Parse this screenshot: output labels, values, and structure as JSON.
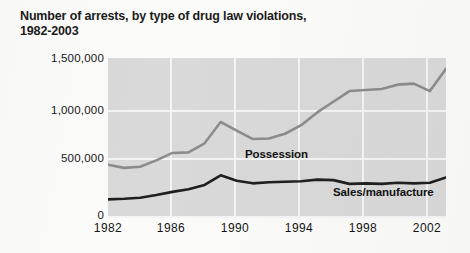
{
  "chart_data": {
    "type": "line",
    "title": "Number of arrests, by type of drug law violations, 1982-2003",
    "xlabel": "",
    "ylabel": "",
    "xlim": [
      1982,
      2003
    ],
    "ylim": [
      0,
      1500000
    ],
    "grid": true,
    "legend_position": "inline-annotation",
    "y_ticks": [
      "0",
      "500,000",
      "1,000,000",
      "1,500,000"
    ],
    "y_tick_values": [
      0,
      500000,
      1000000,
      1500000
    ],
    "x_ticks": [
      "1982",
      "1986",
      "1990",
      "1994",
      "1998",
      "2002"
    ],
    "x_tick_values": [
      1982,
      1986,
      1990,
      1994,
      1998,
      2002
    ],
    "x": [
      1982,
      1983,
      1984,
      1985,
      1986,
      1987,
      1988,
      1989,
      1990,
      1991,
      1992,
      1993,
      1994,
      1995,
      1996,
      1997,
      1998,
      1999,
      2000,
      2001,
      2002,
      2003
    ],
    "series": [
      {
        "name": "Possession",
        "color": "#8c8c8c",
        "values": [
          500000,
          470000,
          480000,
          540000,
          610000,
          615000,
          700000,
          900000,
          820000,
          740000,
          745000,
          790000,
          870000,
          990000,
          1090000,
          1190000,
          1200000,
          1210000,
          1250000,
          1260000,
          1190000,
          1400000
        ]
      },
      {
        "name": "Sales/manufacture",
        "color": "#1f1f1f",
        "values": [
          175000,
          180000,
          190000,
          215000,
          245000,
          270000,
          310000,
          400000,
          350000,
          325000,
          335000,
          340000,
          345000,
          360000,
          355000,
          320000,
          325000,
          320000,
          330000,
          325000,
          330000,
          380000
        ]
      }
    ],
    "annotations": [
      {
        "text": "Possession",
        "series": "Possession"
      },
      {
        "text": "Sales/manufacture",
        "series": "Sales/manufacture"
      }
    ]
  },
  "colors": {
    "plot_background": "#d9d9d9",
    "gridline": "#f4f4f4",
    "page_background": "#fbfbfa",
    "possession_line": "#8c8c8c",
    "sales_line": "#1f1f1f",
    "text": "#171717"
  }
}
